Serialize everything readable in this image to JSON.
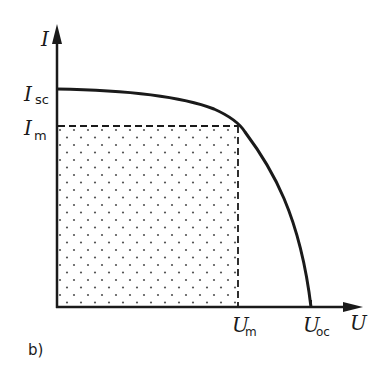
{
  "diagram": {
    "panel_label": "b)",
    "type": "I-U characteristic curve (solar cell)",
    "axes": {
      "y_axis": {
        "label_main": "I",
        "label_sub": ""
      },
      "x_axis": {
        "label_main": "U",
        "label_sub": ""
      }
    },
    "y_ticks": [
      {
        "main": "I",
        "sub": "sc",
        "meaning": "short-circuit current"
      },
      {
        "main": "I",
        "sub": "m",
        "meaning": "current at maximum power point"
      }
    ],
    "x_ticks": [
      {
        "main": "U",
        "sub": "m",
        "meaning": "voltage at maximum power point"
      },
      {
        "main": "U",
        "sub": "oc",
        "meaning": "open-circuit voltage"
      }
    ],
    "elements": {
      "curve": "I-U characteristic from (0, Isc) bending down to (Uoc, 0)",
      "max_power_rectangle": "dashed rectangle from origin to (Um, Im), dotted fill",
      "mpp": "curve touches rectangle corner at (Um, Im)"
    },
    "colors": {
      "ink": "#1a1a1a",
      "background": "#ffffff",
      "dots": "#555555"
    }
  }
}
